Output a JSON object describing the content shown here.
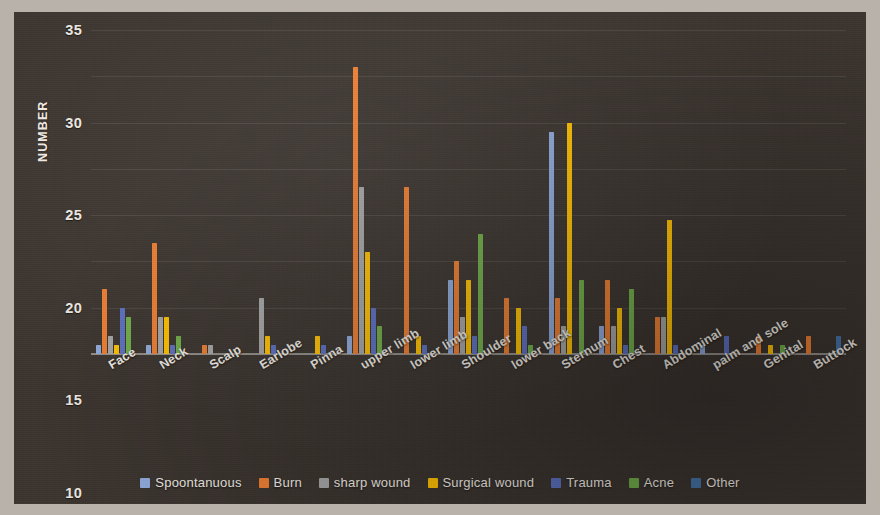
{
  "chart_data": {
    "type": "bar",
    "title": "",
    "xlabel": "",
    "ylabel": "NUMBER",
    "ylim": [
      0,
      35
    ],
    "yticks": [
      0,
      5,
      10,
      15,
      20,
      25,
      30,
      35
    ],
    "grid": true,
    "legend_position": "bottom",
    "categories": [
      "Face",
      "Neck",
      "Scalp",
      "Earlobe",
      "Pinna",
      "upper limb",
      "lower limb",
      "Shoulder",
      "lower back",
      "Sternum",
      "Chest",
      "Abdominal",
      "palm and sole",
      "Genital",
      "Buttock"
    ],
    "series": [
      {
        "name": "Spoontanuous",
        "color": "#8faadc",
        "values": [
          1,
          1,
          0,
          0,
          0,
          2,
          0,
          8,
          0,
          24,
          3,
          0,
          1,
          0,
          0
        ]
      },
      {
        "name": "Burn",
        "color": "#ed7d31",
        "values": [
          7,
          12,
          1,
          0,
          0,
          31,
          18,
          10,
          6,
          6,
          8,
          4,
          0,
          2,
          2
        ]
      },
      {
        "name": "sharp wound",
        "color": "#a5a5a5",
        "values": [
          2,
          4,
          1,
          6,
          0,
          18,
          0,
          4,
          0,
          3,
          3,
          4,
          0,
          0,
          0
        ]
      },
      {
        "name": "Surgical wound",
        "color": "#ffc000",
        "values": [
          1,
          4,
          0,
          2,
          2,
          11,
          2,
          8,
          5,
          25,
          5,
          14.5,
          0,
          1,
          0
        ]
      },
      {
        "name": "Trauma",
        "color": "#5b6fc0",
        "values": [
          5,
          1,
          0,
          1,
          1,
          5,
          1,
          2,
          3,
          0,
          1,
          1,
          2,
          0,
          0
        ]
      },
      {
        "name": "Acne",
        "color": "#70ad47",
        "values": [
          4,
          2,
          0,
          0,
          0,
          3,
          0,
          13,
          1,
          8,
          7,
          0,
          0,
          1,
          0
        ]
      },
      {
        "name": "Other",
        "color": "#4472a8",
        "values": [
          0,
          0,
          0,
          0,
          0,
          0,
          0,
          0,
          0,
          0,
          0,
          0,
          0,
          0,
          2
        ]
      }
    ]
  }
}
